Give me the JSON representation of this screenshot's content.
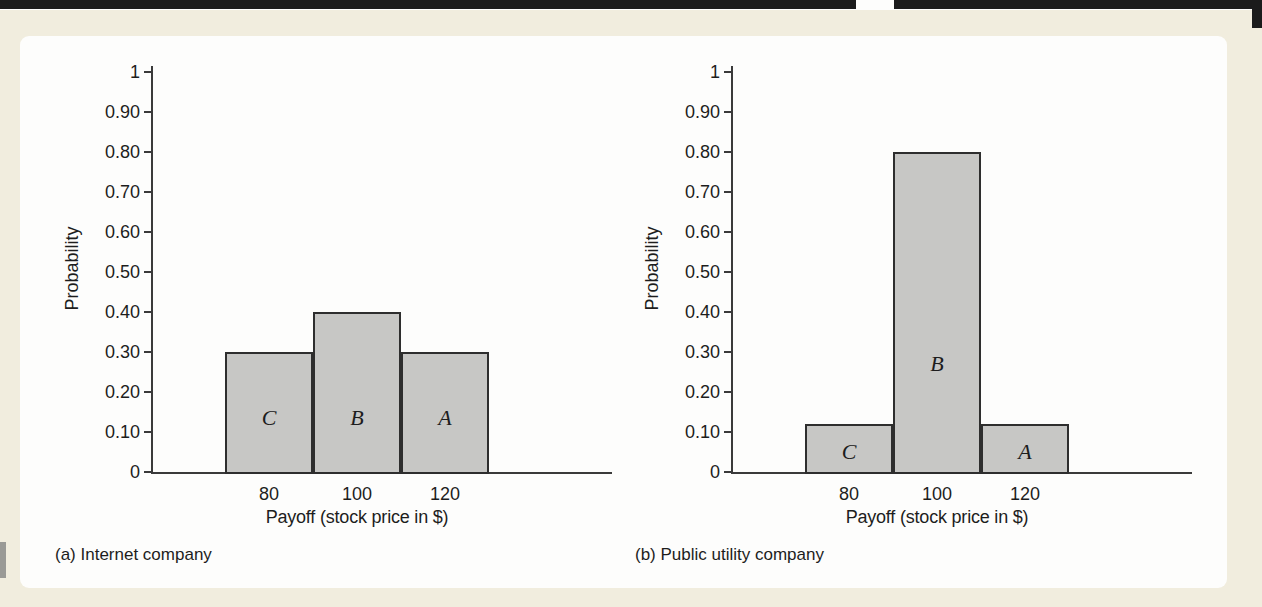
{
  "figure": {
    "background_color": "#f1edde",
    "panel_color": "#fdfdfc",
    "top_bar_color": "#1b1b1b",
    "text_color": "#1d1d1d",
    "axis_color": "#3a3a3a"
  },
  "chart_data": [
    {
      "type": "bar",
      "caption": "(a) Internet company",
      "xlabel": "Payoff (stock price in $)",
      "ylabel": "Probability",
      "categories": [
        "80",
        "100",
        "120"
      ],
      "values": [
        0.3,
        0.4,
        0.3
      ],
      "bar_letters": [
        "C",
        "B",
        "A"
      ],
      "letter_levels": [
        0.135,
        0.135,
        0.135
      ],
      "ylim": [
        0,
        1
      ],
      "ytick_values": [
        0,
        0.1,
        0.2,
        0.3,
        0.4,
        0.5,
        0.6,
        0.7,
        0.8,
        0.9,
        1
      ],
      "ytick_labels": [
        "0",
        "0.10",
        "0.20",
        "0.30",
        "0.40",
        "0.50",
        "0.60",
        "0.70",
        "0.80",
        "0.90",
        "1"
      ],
      "grid": false,
      "legend": "none",
      "bar_fill": "#c7c7c5",
      "bar_border": "#2e2e2e"
    },
    {
      "type": "bar",
      "caption": "(b) Public utility company",
      "xlabel": "Payoff (stock price in $)",
      "ylabel": "Probability",
      "categories": [
        "80",
        "100",
        "120"
      ],
      "values": [
        0.12,
        0.8,
        0.12
      ],
      "bar_letters": [
        "C",
        "B",
        "A"
      ],
      "letter_levels": [
        0.05,
        0.27,
        0.05
      ],
      "ylim": [
        0,
        1
      ],
      "ytick_values": [
        0,
        0.1,
        0.2,
        0.3,
        0.4,
        0.5,
        0.6,
        0.7,
        0.8,
        0.9,
        1
      ],
      "ytick_labels": [
        "0",
        "0.10",
        "0.20",
        "0.30",
        "0.40",
        "0.50",
        "0.60",
        "0.70",
        "0.80",
        "0.90",
        "1"
      ],
      "grid": false,
      "legend": "none",
      "bar_fill": "#c7c7c5",
      "bar_border": "#2e2e2e"
    }
  ]
}
